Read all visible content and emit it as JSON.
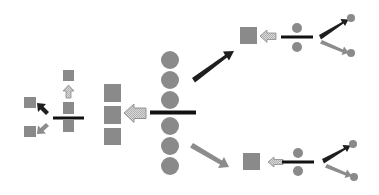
{
  "diagram": {
    "colors": {
      "background": "#ffffff",
      "gray_shape": "#8a8a8a",
      "black_bar": "#111111",
      "black_arrow": "#1e1e1e",
      "gray_arrow": "#8c8c8c",
      "hatched_fill": "#cfcfcf",
      "hatched_stroke": "#8a8a8a"
    },
    "groups": [
      {
        "id": "left-cluster",
        "shapes": "squares with division bar, up hatched arrow, black and gray diverging arrows"
      },
      {
        "id": "square-column",
        "shapes": "three stacked squares"
      },
      {
        "id": "circle-column",
        "shapes": "six stacked circles with division bar"
      },
      {
        "id": "upper-branch",
        "shapes": "square, hatched arrow, divided pair of circles, diverging black/gray arrows"
      },
      {
        "id": "lower-branch",
        "shapes": "square, hatched arrow, divided pair of circles, diverging black/gray arrows"
      }
    ]
  }
}
